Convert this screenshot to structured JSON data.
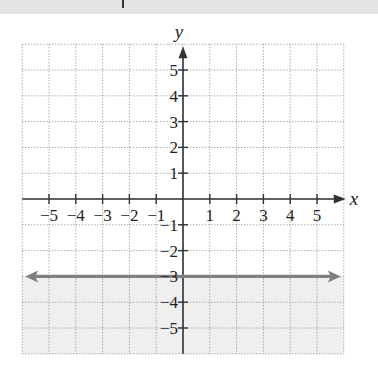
{
  "chart_data": {
    "type": "line",
    "title": "",
    "xlabel": "x",
    "ylabel": "y",
    "xlim": [
      -6,
      6
    ],
    "ylim": [
      -6,
      6
    ],
    "grid": true,
    "x_ticks": [
      -5,
      -4,
      -3,
      -2,
      -1,
      1,
      2,
      3,
      4,
      5
    ],
    "y_ticks": [
      5,
      4,
      3,
      2,
      1,
      -1,
      -2,
      -3,
      -4,
      -5
    ],
    "x_tick_labels": [
      "−5",
      "−4",
      "−3",
      "−2",
      "−1",
      "1",
      "2",
      "3",
      "4",
      "5"
    ],
    "y_tick_labels": [
      "5",
      "4",
      "3",
      "2",
      "1",
      "−1",
      "−2",
      "−3",
      "−4",
      "−5"
    ],
    "series": [
      {
        "name": "y = -3",
        "kind": "horizontal-line",
        "equation": "y = -3",
        "y": -3,
        "x": [
          -6,
          6
        ],
        "values": [
          -3,
          -3
        ],
        "arrows": "both",
        "style": "solid",
        "color": "#808080"
      }
    ],
    "shaded_region": {
      "description": "y < -3",
      "below": -3,
      "color": "#efefef"
    },
    "legend": null
  },
  "colors": {
    "axis": "#333333",
    "grid": "#9a9a9a",
    "line": "#808080",
    "shade": "#efefef",
    "top_band": "#e4e4e4"
  }
}
